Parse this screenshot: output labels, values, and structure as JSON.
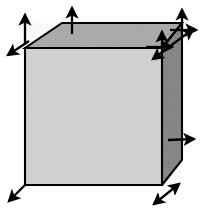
{
  "figure": {
    "background_color": "#ffffff",
    "width": 205,
    "height": 214
  },
  "colors": {
    "front_face": "#d2d2d2",
    "top_face": "#a8a8a8",
    "right_face": "#808080",
    "outline": "#000000",
    "arrow": "#000000",
    "background": "#ffffff"
  },
  "cube": {
    "label": "cube",
    "vertices": {
      "front_top_left": [
        25,
        48
      ],
      "front_top_right": [
        162,
        48
      ],
      "front_bottom_left": [
        25,
        185
      ],
      "front_bottom_right": [
        162,
        185
      ],
      "back_top_left": [
        62,
        23
      ],
      "back_top_right": [
        182,
        23
      ],
      "back_bottom_right": [
        182,
        160
      ]
    },
    "faces": [
      {
        "name": "front-face",
        "fill": "#d2d2d2",
        "points": "25,48 162,48 162,185 25,185"
      },
      {
        "name": "top-face",
        "fill": "#a8a8a8",
        "points": "25,48 62,23 182,23 162,48"
      },
      {
        "name": "right-face",
        "fill": "#808080",
        "points": "162,48 182,23 182,160 162,185"
      }
    ]
  },
  "arrows": [
    {
      "name": "arrow-back-top-left-up",
      "direction": "up",
      "from": [
        25,
        45
      ],
      "to": [
        25,
        13
      ],
      "double_headed": false
    },
    {
      "name": "arrow-back-top-left-down-left",
      "direction": "down-left",
      "from": [
        28,
        42
      ],
      "to": [
        4,
        57
      ],
      "double_headed": false
    },
    {
      "name": "arrow-top-center-up",
      "direction": "up",
      "from": [
        72,
        34
      ],
      "to": [
        72,
        5
      ],
      "double_headed": false
    },
    {
      "name": "arrow-back-top-right-up",
      "direction": "up",
      "from": [
        182,
        34
      ],
      "to": [
        182,
        8
      ],
      "double_headed": false
    },
    {
      "name": "arrow-back-top-right-right",
      "direction": "right",
      "from": [
        170,
        30
      ],
      "to": [
        199,
        30
      ],
      "double_headed": false
    },
    {
      "name": "arrow-front-top-right-diagonal",
      "direction": "up-right-down-left",
      "from": [
        151,
        60
      ],
      "to": [
        196,
        27
      ],
      "double_headed": true
    },
    {
      "name": "arrow-front-top-right-inner-up",
      "direction": "up",
      "from": [
        162,
        48
      ],
      "to": [
        162,
        30
      ],
      "double_headed": false
    },
    {
      "name": "arrow-front-top-right-inner-right",
      "direction": "right",
      "from": [
        144,
        47
      ],
      "to": [
        174,
        47
      ],
      "double_headed": false
    },
    {
      "name": "arrow-right-face-middle-right",
      "direction": "right",
      "from": [
        168,
        140
      ],
      "to": [
        196,
        139
      ],
      "double_headed": false
    },
    {
      "name": "arrow-front-bottom-left-down-left",
      "direction": "down-left",
      "from": [
        25,
        185
      ],
      "to": [
        6,
        204
      ],
      "double_headed": false
    },
    {
      "name": "arrow-front-bottom-right-diagonal",
      "direction": "up-right-down-left",
      "from": [
        151,
        207
      ],
      "to": [
        181,
        182
      ],
      "double_headed": true
    }
  ]
}
